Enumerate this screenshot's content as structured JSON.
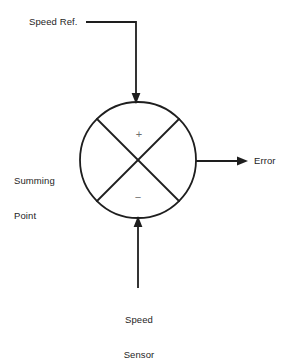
{
  "diagram": {
    "type": "control-system-block-diagram",
    "background_color": "#ffffff",
    "line_color": "#1e1e1e",
    "sign_color": "#6e6e6e",
    "labels": {
      "speed_ref": "Speed Ref.",
      "summing_point_line1": "Summing",
      "summing_point_line2": "Point",
      "error": "Error",
      "speed_sensor_line1": "Speed",
      "speed_sensor_line2": "Sensor"
    },
    "signs": {
      "plus": "+",
      "minus": "−"
    },
    "summing_circle": {
      "center_x": 138,
      "center_y": 160,
      "radius": 58
    },
    "connections": [
      {
        "name": "speed-ref-input",
        "label": "Speed Ref.",
        "direction": "into-summing-point",
        "enters_at": "top",
        "sign": "+",
        "arrow": true
      },
      {
        "name": "speed-sensor-input",
        "label": "Speed Sensor",
        "direction": "into-summing-point",
        "enters_at": "bottom",
        "sign": "−",
        "arrow": true
      },
      {
        "name": "error-output",
        "label": "Error",
        "direction": "out-of-summing-point",
        "exits_at": "right",
        "arrow": true
      }
    ]
  }
}
